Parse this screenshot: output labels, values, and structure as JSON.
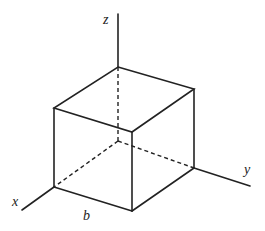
{
  "diagram": {
    "labels": {
      "x_axis": "x",
      "y_axis": "y",
      "z_axis": "z",
      "edge_length": "b"
    },
    "colors": {
      "line": "#222222",
      "background": "#ffffff"
    }
  }
}
